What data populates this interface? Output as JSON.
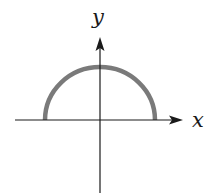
{
  "diagram": {
    "type": "graph-of-function",
    "curve": "upper semicircle centered at origin",
    "axes": {
      "x_label": "x",
      "y_label": "y"
    },
    "colors": {
      "axis": "#1a1a1a",
      "curve": "#7a7a7a",
      "background": "#ffffff"
    }
  }
}
